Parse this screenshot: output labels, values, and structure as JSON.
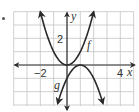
{
  "chart_data": {
    "type": "line",
    "title": "",
    "xlabel": "x",
    "ylabel": "y",
    "xlim": [
      -4,
      5
    ],
    "ylim": [
      -3,
      4
    ],
    "grid": true,
    "x_tick_labels": [
      {
        "value": -2,
        "label": "−2"
      },
      {
        "value": 4,
        "label": "4"
      }
    ],
    "y_tick_labels": [
      {
        "value": 2,
        "label": "2"
      }
    ],
    "series": [
      {
        "name": "f",
        "equation": "f(x) = x^2",
        "vertex": [
          0,
          0
        ],
        "opens": "up",
        "x": [
          -2,
          -1,
          0,
          1,
          2
        ],
        "values": [
          4,
          1,
          0,
          1,
          4
        ]
      },
      {
        "name": "g",
        "equation": "g(x) = -(x-1)^2",
        "vertex": [
          1,
          0
        ],
        "opens": "down",
        "x": [
          -0.7,
          0,
          1,
          2,
          2.7
        ],
        "values": [
          -2.9,
          -1,
          0,
          -1,
          -2.9
        ]
      }
    ],
    "curve_labels": [
      {
        "text": "f",
        "series": "f"
      },
      {
        "text": "g",
        "series": "g"
      }
    ]
  },
  "labels": {
    "x_axis": "x",
    "y_axis": "y",
    "tick_neg2": "−2",
    "tick_4": "4",
    "tick_2": "2",
    "curve_f": "f",
    "curve_g": "g"
  },
  "colors": {
    "grid": "#bdbdbd",
    "axis": "#333333",
    "curve": "#2a2a2a"
  }
}
